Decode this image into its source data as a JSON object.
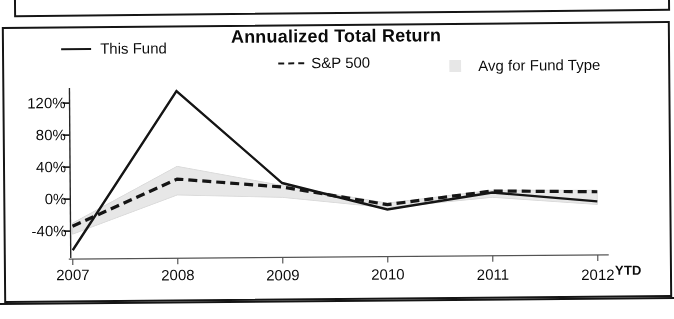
{
  "chart_data": {
    "type": "line",
    "title": "Annualized Total Return",
    "xlabel": "",
    "ylabel": "",
    "x": [
      "2007",
      "2008",
      "2009",
      "2010",
      "2011",
      "2012"
    ],
    "x_axis_note": "YTD",
    "ylim": [
      -80,
      140
    ],
    "ytick_labels": [
      "120%",
      "80%",
      "40%",
      "0%",
      "-40%"
    ],
    "ytick_values": [
      120,
      80,
      40,
      0,
      -40
    ],
    "grid": false,
    "legend_position": "top",
    "series": [
      {
        "name": "This Fund",
        "style": "solid",
        "color": "#1a1a1a",
        "values": [
          -64,
          134,
          18,
          -16,
          4,
          -8
        ]
      },
      {
        "name": "S&P 500",
        "style": "dashed",
        "color": "#1a1a1a",
        "values": [
          -34,
          24,
          13,
          -10,
          6,
          4
        ]
      },
      {
        "name": "Avg for Fund Type",
        "style": "band",
        "color": "#e2e2e2",
        "band_upper": [
          -30,
          40,
          15,
          -8,
          7,
          6
        ],
        "band_lower": [
          -44,
          4,
          0,
          -14,
          -2,
          -12
        ]
      }
    ]
  },
  "chart": {
    "title": "Annualized Total Return",
    "legend": [
      {
        "label": "This Fund",
        "marker": "solid-line-swatch"
      },
      {
        "label": "S&P 500",
        "marker": "dashed-line-swatch"
      },
      {
        "label": "Avg for Fund Type",
        "marker": "shaded-box-swatch"
      }
    ],
    "y_axis": {
      "ticks": [
        "120%",
        "80%",
        "40%",
        "0%",
        "-40%"
      ]
    },
    "x_axis": {
      "ticks": [
        "2007",
        "2008",
        "2009",
        "2010",
        "2011",
        "2012"
      ],
      "suffix": "YTD"
    }
  }
}
